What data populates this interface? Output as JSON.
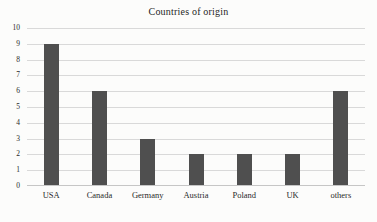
{
  "chart_data": {
    "type": "bar",
    "title": "Countries of origin",
    "categories": [
      "USA",
      "Canada",
      "Germany",
      "Austria",
      "Poland",
      "UK",
      "others"
    ],
    "values": [
      9,
      6,
      3,
      2,
      2,
      2,
      6
    ],
    "xlabel": "",
    "ylabel": "",
    "ylim": [
      0,
      10
    ],
    "ytick_step": 1,
    "grid": "horizontal",
    "legend": "none",
    "colors": {
      "bar": "#4f4f4f",
      "gridline": "#d9d9d9",
      "axis": "#c6c6c6",
      "text": "#2a2a2a",
      "background": "#fcfcfb"
    }
  }
}
